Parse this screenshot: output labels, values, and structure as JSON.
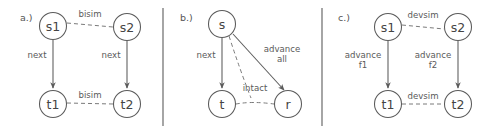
{
  "figure": {
    "background": "#ffffff",
    "stroke_color": "#5b5b5b",
    "dashed_color": "#7a7a7a",
    "text_color": "#555555",
    "panel_count": 3
  },
  "panels": [
    {
      "id": "panel-a",
      "label": "a.)",
      "nodes": [
        {
          "id": "a-s1",
          "label": "s1",
          "cx": 53,
          "cy": 26
        },
        {
          "id": "a-s2",
          "label": "s2",
          "cx": 127,
          "cy": 27
        },
        {
          "id": "a-t1",
          "label": "t1",
          "cx": 53,
          "cy": 104
        },
        {
          "id": "a-t2",
          "label": "t2",
          "cx": 127,
          "cy": 104
        }
      ],
      "edges": [
        {
          "id": "a-e1",
          "from": "s1",
          "to": "s2",
          "style": "dashed",
          "arrow": false,
          "label": "bisim"
        },
        {
          "id": "a-e2",
          "from": "s1",
          "to": "t1",
          "style": "solid",
          "arrow": true,
          "label": "next"
        },
        {
          "id": "a-e3",
          "from": "s2",
          "to": "t2",
          "style": "solid",
          "arrow": true,
          "label": "next"
        },
        {
          "id": "a-e4",
          "from": "t1",
          "to": "t2",
          "style": "dashed",
          "arrow": false,
          "label": "bisim"
        }
      ]
    },
    {
      "id": "panel-b",
      "label": "b.)",
      "nodes": [
        {
          "id": "b-s",
          "label": "s",
          "cx": 222,
          "cy": 24
        },
        {
          "id": "b-t",
          "label": "t",
          "cx": 222,
          "cy": 104
        },
        {
          "id": "b-r",
          "label": "r",
          "cx": 288,
          "cy": 104
        }
      ],
      "edges": [
        {
          "id": "b-e1",
          "from": "s",
          "to": "t",
          "style": "solid",
          "arrow": true,
          "label": "next"
        },
        {
          "id": "b-e2",
          "from": "s",
          "to": "r",
          "style": "solid",
          "arrow": true,
          "label_line1": "advance",
          "label_line2": "all"
        },
        {
          "id": "b-e3",
          "from": "s",
          "to": "t-r-edge",
          "style": "dashed",
          "arrow": false,
          "label": "intact"
        },
        {
          "id": "b-e4",
          "from": "t",
          "to": "r",
          "style": "dashed",
          "arrow": false,
          "label": ""
        }
      ]
    },
    {
      "id": "panel-c",
      "label": "c.)",
      "nodes": [
        {
          "id": "c-s1",
          "label": "s1",
          "cx": 388,
          "cy": 27
        },
        {
          "id": "c-s2",
          "label": "s2",
          "cx": 458,
          "cy": 27
        },
        {
          "id": "c-t1",
          "label": "t1",
          "cx": 388,
          "cy": 104
        },
        {
          "id": "c-t2",
          "label": "t2",
          "cx": 458,
          "cy": 104
        }
      ],
      "edges": [
        {
          "id": "c-e1",
          "from": "s1",
          "to": "s2",
          "style": "dashed",
          "arrow": false,
          "label": "devsim"
        },
        {
          "id": "c-e2",
          "from": "s1",
          "to": "t1",
          "style": "solid",
          "arrow": true,
          "label_line1": "advance",
          "label_line2": "f1"
        },
        {
          "id": "c-e3",
          "from": "s2",
          "to": "t2",
          "style": "solid",
          "arrow": true,
          "label_line1": "advance",
          "label_line2": "f2"
        },
        {
          "id": "c-e4",
          "from": "t1",
          "to": "t2",
          "style": "dashed",
          "arrow": false,
          "label": "devsim"
        }
      ]
    }
  ],
  "dividers": [
    {
      "id": "divider-1",
      "x": 163,
      "y1": 8,
      "y2": 126
    },
    {
      "id": "divider-2",
      "x": 322,
      "y1": 8,
      "y2": 126
    }
  ]
}
